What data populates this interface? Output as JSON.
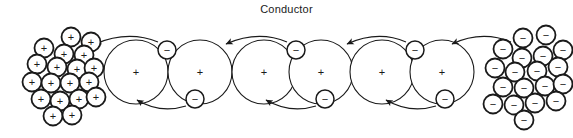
{
  "title": "Conductor",
  "colors": {
    "ink": "#1a1a1a",
    "stroke": "#2b2b2b",
    "background": "#ffffff"
  },
  "diagram": {
    "type": "physics-conduction-diagram",
    "atom_symbol": "+",
    "electron_symbol": "−",
    "left_cluster_symbol": "+",
    "right_cluster_symbol": "−",
    "atom_radius": 32,
    "electron_radius": 9,
    "cluster_radius": 9.5,
    "atoms": [
      {
        "cx": 136,
        "cy": 72
      },
      {
        "cx": 200,
        "cy": 72
      },
      {
        "cx": 264,
        "cy": 72
      },
      {
        "cx": 321,
        "cy": 72
      },
      {
        "cx": 382,
        "cy": 72
      },
      {
        "cx": 442,
        "cy": 72
      }
    ],
    "electrons": [
      {
        "cx": 167,
        "cy": 50
      },
      {
        "cx": 195,
        "cy": 99
      },
      {
        "cx": 296,
        "cy": 50
      },
      {
        "cx": 325,
        "cy": 99
      },
      {
        "cx": 415,
        "cy": 50
      },
      {
        "cx": 445,
        "cy": 99
      }
    ],
    "arrows": [
      {
        "from_x": 158,
        "from_y": 42,
        "ctrl_x": 128,
        "ctrl_y": 30,
        "to_x": 95,
        "to_y": 44
      },
      {
        "from_x": 186,
        "from_y": 106,
        "ctrl_x": 160,
        "ctrl_y": 114,
        "to_x": 137,
        "to_y": 100
      },
      {
        "from_x": 287,
        "from_y": 42,
        "ctrl_x": 258,
        "ctrl_y": 30,
        "to_x": 226,
        "to_y": 44
      },
      {
        "from_x": 316,
        "from_y": 106,
        "ctrl_x": 290,
        "ctrl_y": 114,
        "to_x": 266,
        "to_y": 100
      },
      {
        "from_x": 406,
        "from_y": 42,
        "ctrl_x": 378,
        "ctrl_y": 30,
        "to_x": 347,
        "to_y": 44
      },
      {
        "from_x": 436,
        "from_y": 106,
        "ctrl_x": 410,
        "ctrl_y": 114,
        "to_x": 386,
        "to_y": 100
      },
      {
        "from_x": 511,
        "from_y": 42,
        "ctrl_x": 482,
        "ctrl_y": 30,
        "to_x": 452,
        "to_y": 44
      }
    ],
    "left_cluster": [
      {
        "cx": 71,
        "cy": 37
      },
      {
        "cx": 91,
        "cy": 42
      },
      {
        "cx": 44,
        "cy": 48
      },
      {
        "cx": 64,
        "cy": 54
      },
      {
        "cx": 84,
        "cy": 55
      },
      {
        "cx": 37,
        "cy": 64
      },
      {
        "cx": 57,
        "cy": 67
      },
      {
        "cx": 77,
        "cy": 69
      },
      {
        "cx": 94,
        "cy": 68
      },
      {
        "cx": 32,
        "cy": 82
      },
      {
        "cx": 51,
        "cy": 83
      },
      {
        "cx": 70,
        "cy": 83
      },
      {
        "cx": 89,
        "cy": 82
      },
      {
        "cx": 41,
        "cy": 99
      },
      {
        "cx": 60,
        "cy": 101
      },
      {
        "cx": 79,
        "cy": 99
      },
      {
        "cx": 96,
        "cy": 97
      },
      {
        "cx": 53,
        "cy": 116
      },
      {
        "cx": 72,
        "cy": 115
      }
    ],
    "right_cluster": [
      {
        "cx": 523,
        "cy": 38
      },
      {
        "cx": 546,
        "cy": 35
      },
      {
        "cx": 503,
        "cy": 49
      },
      {
        "cx": 563,
        "cy": 50
      },
      {
        "cx": 522,
        "cy": 58
      },
      {
        "cx": 543,
        "cy": 56
      },
      {
        "cx": 495,
        "cy": 68
      },
      {
        "cx": 515,
        "cy": 72
      },
      {
        "cx": 537,
        "cy": 71
      },
      {
        "cx": 558,
        "cy": 67
      },
      {
        "cx": 503,
        "cy": 87
      },
      {
        "cx": 524,
        "cy": 88
      },
      {
        "cx": 545,
        "cy": 86
      },
      {
        "cx": 563,
        "cy": 84
      },
      {
        "cx": 493,
        "cy": 104
      },
      {
        "cx": 514,
        "cy": 105
      },
      {
        "cx": 535,
        "cy": 103
      },
      {
        "cx": 556,
        "cy": 101
      },
      {
        "cx": 524,
        "cy": 120
      }
    ]
  }
}
